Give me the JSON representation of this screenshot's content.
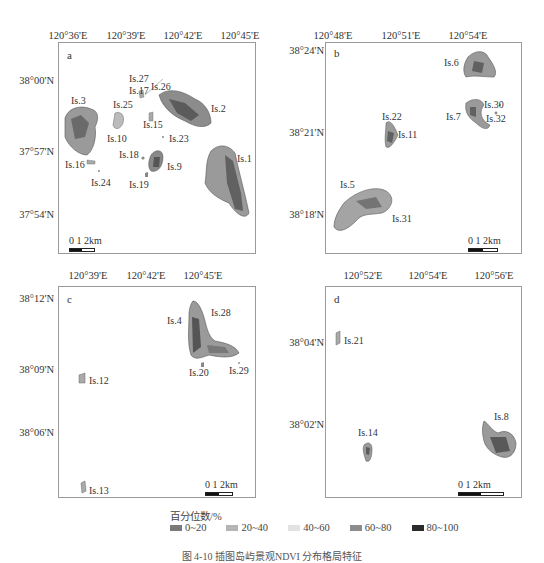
{
  "panels": {
    "a": {
      "letter": "a",
      "x_ticks": [
        "120°36'E",
        "120°39'E",
        "120°42'E",
        "120°45'E"
      ],
      "y_ticks": [
        "38°00'N",
        "37°57'N",
        "37°54'N"
      ],
      "islands": [
        "Is.1",
        "Is.2",
        "Is.3",
        "Is.9",
        "Is.10",
        "Is.15",
        "Is.16",
        "Is.17",
        "Is.18",
        "Is.19",
        "Is.23",
        "Is.24",
        "Is.25",
        "Is.26",
        "Is.27"
      ],
      "scale": {
        "labels": "0  1   2km"
      }
    },
    "b": {
      "letter": "b",
      "x_ticks": [
        "120°48'E",
        "120°51'E",
        "120°54'E"
      ],
      "y_ticks": [
        "38°24'N",
        "38°21'N",
        "38°18'N"
      ],
      "islands": [
        "Is.5",
        "Is.6",
        "Is.7",
        "Is.11",
        "Is.22",
        "Is.30",
        "Is.31",
        "Is.32"
      ],
      "scale": {
        "labels": "0  1   2km"
      }
    },
    "c": {
      "letter": "c",
      "x_ticks": [
        "120°39'E",
        "120°42'E",
        "120°45'E"
      ],
      "y_ticks": [
        "38°12'N",
        "38°09'N",
        "38°06'N"
      ],
      "islands": [
        "Is.4",
        "Is.12",
        "Is.13",
        "Is.20",
        "Is.28",
        "Is.29"
      ],
      "scale": {
        "labels": "0  1   2km"
      }
    },
    "d": {
      "letter": "d",
      "x_ticks": [
        "120°52'E",
        "120°54'E",
        "120°56'E"
      ],
      "y_ticks": [
        "38°04'N",
        "38°02'N"
      ],
      "islands": [
        "Is.8",
        "Is.14",
        "Is.21"
      ],
      "scale": {
        "labels": "0       1      2km"
      }
    }
  },
  "legend": {
    "title": "百分位数/%",
    "items": [
      {
        "label": "0~20",
        "color": "#7a7a7a"
      },
      {
        "label": "20~40",
        "color": "#b5b5b5"
      },
      {
        "label": "40~60",
        "color": "#e3e3e3"
      },
      {
        "label": "60~80",
        "color": "#8c8c8c"
      },
      {
        "label": "80~100",
        "color": "#2b2b2b"
      }
    ]
  },
  "caption": "图 4-10   插图岛屿景观NDVI 分布格局特征",
  "colors": {
    "frame": "#9a9a9a",
    "land_light": "#c8c8c8",
    "land_mid": "#8a8a8a",
    "land_dark": "#333333"
  }
}
